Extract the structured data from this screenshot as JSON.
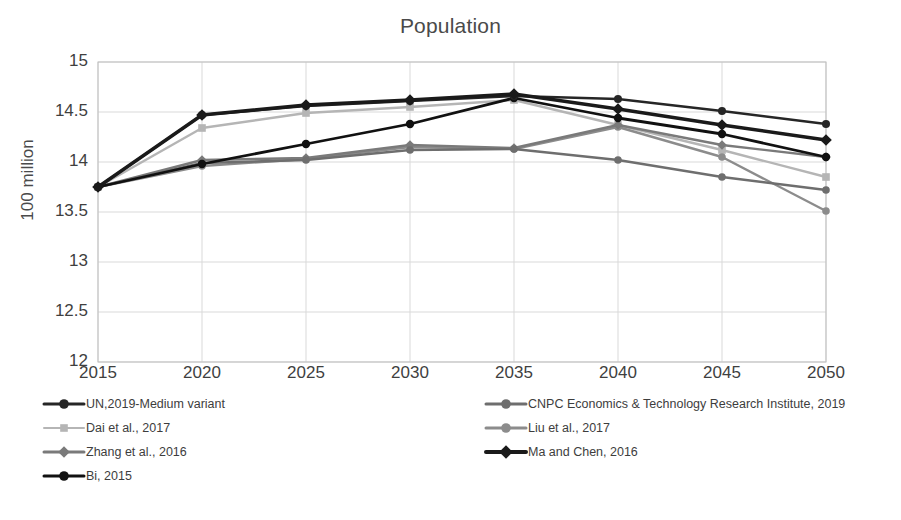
{
  "chart_data": {
    "type": "line",
    "title": "Population",
    "xlabel": "",
    "ylabel": "100 million",
    "x": [
      2015,
      2020,
      2025,
      2030,
      2035,
      2040,
      2045,
      2050
    ],
    "xtick_labels": [
      "2015",
      "2020",
      "2025",
      "2030",
      "2035",
      "2040",
      "2045",
      "2050"
    ],
    "ytick_labels": [
      "15",
      "14.5",
      "14",
      "13.5",
      "13",
      "12.5",
      "12"
    ],
    "yticks": [
      15,
      14.5,
      14,
      13.5,
      13,
      12.5,
      12
    ],
    "xlim": [
      2015,
      2050
    ],
    "ylim": [
      12,
      15
    ],
    "grid": true,
    "legend_position": "bottom",
    "series": [
      {
        "name": "UN,2019-Medium variant",
        "color": "#262626",
        "marker": "circle",
        "width": 2.6,
        "values": [
          13.75,
          14.47,
          14.56,
          14.61,
          14.66,
          14.63,
          14.51,
          14.38
        ]
      },
      {
        "name": "CNPC Economics & Technology Research Institute, 2019",
        "color": "#6e6e6e",
        "marker": "circle",
        "width": 2.4,
        "values": [
          13.75,
          13.99,
          14.02,
          14.12,
          14.13,
          14.02,
          13.85,
          13.72
        ]
      },
      {
        "name": "Dai et al., 2017",
        "color": "#b5b5b5",
        "marker": "square",
        "width": 2.4,
        "values": [
          13.75,
          14.34,
          14.49,
          14.55,
          14.62,
          14.37,
          14.12,
          13.85
        ]
      },
      {
        "name": "Liu et al., 2017",
        "color": "#8c8c8c",
        "marker": "circle",
        "width": 2.4,
        "values": [
          13.75,
          13.96,
          14.03,
          14.15,
          14.13,
          14.35,
          14.05,
          13.51
        ]
      },
      {
        "name": "Zhang et al., 2016",
        "color": "#7a7a7a",
        "marker": "diamond",
        "width": 2.4,
        "values": [
          13.75,
          14.02,
          14.04,
          14.17,
          14.14,
          14.37,
          14.17,
          14.05
        ]
      },
      {
        "name": "Ma and Chen, 2016",
        "color": "#1a1a1a",
        "marker": "diamond",
        "width": 3.4,
        "values": [
          13.75,
          14.47,
          14.57,
          14.62,
          14.68,
          14.53,
          14.37,
          14.22
        ]
      },
      {
        "name": "Bi, 2015",
        "color": "#111111",
        "marker": "circle",
        "width": 2.8,
        "values": [
          13.75,
          13.98,
          14.18,
          14.38,
          14.64,
          14.44,
          14.28,
          14.05
        ]
      }
    ]
  },
  "legend": {
    "left_column": [
      {
        "label": "UN,2019-Medium variant",
        "color": "#262626",
        "marker": "circle",
        "width": 3
      },
      {
        "label": "Dai et al., 2017",
        "color": "#b5b5b5",
        "marker": "square",
        "width": 2
      },
      {
        "label": "Zhang et al., 2016",
        "color": "#7a7a7a",
        "marker": "diamond",
        "width": 3
      },
      {
        "label": "Bi, 2015",
        "color": "#111111",
        "marker": "circle",
        "width": 3
      }
    ],
    "right_column": [
      {
        "label": "CNPC Economics & Technology Research Institute, 2019",
        "color": "#6e6e6e",
        "marker": "circle",
        "width": 3
      },
      {
        "label": "Liu et al., 2017",
        "color": "#8c8c8c",
        "marker": "circle",
        "width": 3
      },
      {
        "label": "Ma and Chen, 2016",
        "color": "#1a1a1a",
        "marker": "diamond",
        "width": 4
      }
    ]
  },
  "axes": {
    "grid_color": "#d9d9d9",
    "border_color": "#bfbfbf"
  }
}
